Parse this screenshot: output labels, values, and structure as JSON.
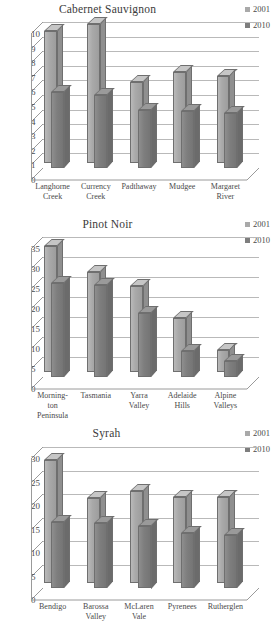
{
  "figure": {
    "series_colors": {
      "s2001": "#a9a9a9",
      "s2010": "#7e7e7e"
    },
    "legend_labels": [
      "2001",
      "2010"
    ]
  },
  "chart_data": [
    {
      "type": "bar",
      "title": "Cabernet Sauvignon",
      "xlabel": "",
      "ylabel": "",
      "ylim": [
        0,
        10
      ],
      "yticks": [
        "0",
        "1",
        "2",
        "3",
        "4",
        "5",
        "6",
        "7",
        "8",
        "9",
        "10"
      ],
      "grid": true,
      "legend_position": "top-right",
      "legend": [
        "2001",
        "2010"
      ],
      "categories": [
        "Langhorne Creek",
        "Currency Creek",
        "Padthaway",
        "Mudgee",
        "Margaret River"
      ],
      "category_lines": [
        [
          "Langhorne",
          "Creek"
        ],
        [
          "Currency",
          "Creek"
        ],
        [
          "Padthaway"
        ],
        [
          "Mudgee"
        ],
        [
          "Margaret",
          "River"
        ]
      ],
      "series": [
        {
          "name": "2001",
          "values": [
            9.0,
            9.5,
            5.5,
            6.2,
            5.9
          ]
        },
        {
          "name": "2010",
          "values": [
            5.2,
            5.0,
            4.0,
            3.9,
            3.8
          ]
        }
      ]
    },
    {
      "type": "bar",
      "title": "Pinot Noir",
      "xlabel": "",
      "ylabel": "",
      "ylim": [
        0,
        35
      ],
      "yticks": [
        "0",
        "5",
        "10",
        "15",
        "20",
        "25",
        "30",
        "35"
      ],
      "grid": true,
      "legend_position": "top-right",
      "legend": [
        "2001",
        "2010"
      ],
      "categories": [
        "Mornington Peninsula",
        "Tasmania",
        "Yarra Valley",
        "Adelaide Hills",
        "Alpine Valleys"
      ],
      "category_lines": [
        [
          "Morning-",
          "ton",
          "Peninsula"
        ],
        [
          "Tasmania"
        ],
        [
          "Yarra",
          "Valley"
        ],
        [
          "Adelaide",
          "Hills"
        ],
        [
          "Alpine",
          "Valleys"
        ]
      ],
      "series": [
        {
          "name": "2001",
          "values": [
            31.5,
            25.0,
            21.5,
            13.5,
            5.5
          ]
        },
        {
          "name": "2010",
          "values": [
            23.5,
            23.0,
            16.0,
            6.5,
            4.0
          ]
        }
      ]
    },
    {
      "type": "bar",
      "title": "Syrah",
      "xlabel": "",
      "ylabel": "",
      "ylim": [
        0,
        30
      ],
      "yticks": [
        "0",
        "5",
        "10",
        "15",
        "20",
        "25",
        "30"
      ],
      "grid": true,
      "legend_position": "top-right",
      "legend": [
        "2001",
        "2010"
      ],
      "categories": [
        "Bendigo",
        "Barossa Valley",
        "McLaren Vale",
        "Pyrenees",
        "Rutherglen"
      ],
      "category_lines": [
        [
          "Bendigo"
        ],
        [
          "Barossa",
          "Valley"
        ],
        [
          "McLaren",
          "Vale"
        ],
        [
          "Pyrenees"
        ],
        [
          "Rutherglen"
        ]
      ],
      "series": [
        {
          "name": "2001",
          "values": [
            26.0,
            18.0,
            19.5,
            18.3,
            18.3
          ]
        },
        {
          "name": "2010",
          "values": [
            14.0,
            13.8,
            13.3,
            11.7,
            11.3
          ]
        }
      ]
    }
  ]
}
